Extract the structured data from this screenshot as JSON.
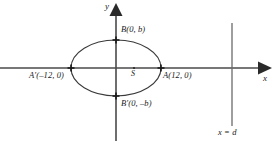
{
  "figure": {
    "type": "geometry-diagram",
    "background_color": "#ffffff",
    "stroke_color": "#3a3a3a",
    "text_color": "#1a1a1a"
  },
  "axes": {
    "x_label": "x",
    "y_label": "y",
    "x_axis": {
      "y_pixel": 68,
      "x_start": 0,
      "x_end": 272,
      "arrow": "right"
    },
    "y_axis": {
      "x_pixel": 116,
      "y_start": 8,
      "y_end": 141,
      "arrow": "up"
    }
  },
  "ellipse": {
    "center_pixel": {
      "x": 116,
      "y": 68
    },
    "rx_pixel": 45,
    "ry_pixel": 28,
    "semi_major_axis": 12,
    "semi_minor_axis": "b"
  },
  "points": [
    {
      "name": "B",
      "label": "B(0, b)",
      "marker_pixel": {
        "x": 116,
        "y": 40
      },
      "label_pixel": {
        "x": 121,
        "y": 29
      }
    },
    {
      "name": "A'",
      "label": "A′(–12, 0)",
      "marker_pixel": {
        "x": 71,
        "y": 68
      },
      "label_pixel": {
        "x": 30,
        "y": 73
      }
    },
    {
      "name": "A",
      "label": "A(12, 0)",
      "marker_pixel": {
        "x": 161,
        "y": 68
      },
      "label_pixel": {
        "x": 161,
        "y": 73
      }
    },
    {
      "name": "B'",
      "label": "B′(0, –b)",
      "marker_pixel": {
        "x": 116,
        "y": 96
      },
      "label_pixel": {
        "x": 121,
        "y": 100
      }
    },
    {
      "name": "S",
      "label": "S",
      "marker_pixel": {
        "x": 134,
        "y": 68
      },
      "label_pixel": {
        "x": 131,
        "y": 72
      }
    }
  ],
  "directrix": {
    "label": "x = d",
    "x_pixel": 232,
    "y_start": 23,
    "y_end": 126,
    "label_pixel": {
      "x": 219,
      "y": 130
    }
  }
}
